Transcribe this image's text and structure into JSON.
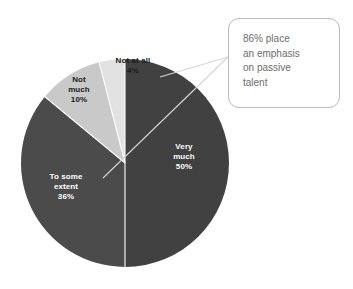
{
  "chart_data": {
    "type": "pie",
    "title": "",
    "categories": [
      "Very much",
      "To some extent",
      "Not much",
      "Not at all"
    ],
    "values": [
      50,
      36,
      10,
      4
    ],
    "value_labels": [
      "50%",
      "36%",
      "10%",
      "4%"
    ],
    "unit": "%",
    "total": 100,
    "legend": "none",
    "grid": false,
    "slices": [
      {
        "label": "Very much",
        "label_line1": "Very",
        "label_line2": "much",
        "value": 50,
        "value_label": "50%",
        "color": "#414141",
        "text_color": "#ffffff",
        "start_angle": 0,
        "end_angle": 180
      },
      {
        "label": "To some extent",
        "label_line1": "To some",
        "label_line2": "extent",
        "value": 36,
        "value_label": "36%",
        "color": "#4b4b4b",
        "text_color": "#ffffff",
        "start_angle": 180,
        "end_angle": 309.6
      },
      {
        "label": "Not much",
        "label_line1": "Not",
        "label_line2": "much",
        "value": 10,
        "value_label": "10%",
        "color": "#c9c9c9",
        "text_color": "#1a1a1a",
        "start_angle": 309.6,
        "end_angle": 345.6
      },
      {
        "label": "Not at all",
        "label_line1": "Not at all",
        "label_line2": "",
        "value": 4,
        "value_label": "4%",
        "color": "#e2e2e2",
        "text_color": "#1a1a1a",
        "start_angle": 345.6,
        "end_angle": 360
      }
    ],
    "annotations": [
      {
        "name": "passive-talent-callout",
        "lines": [
          "86% place",
          "an emphasis",
          "on passive",
          "talent"
        ],
        "text": "86% place an emphasis on passive talent",
        "value": 86,
        "value_label": "86%",
        "border_color": "#b9b9b9",
        "text_color": "#6d6d6d",
        "background": "#ffffff"
      }
    ],
    "colors": {
      "very_much": "#414141",
      "to_some_extent": "#4b4b4b",
      "not_much": "#c9c9c9",
      "not_at_all": "#e2e2e2",
      "background": "#ffffff",
      "slice_divider": "#ffffff",
      "leader_line": "#d6d6d6"
    },
    "geometry": {
      "center_x": 125,
      "center_y": 163,
      "radius": 104
    }
  },
  "callout": {
    "line1": "86% place",
    "line2": "an emphasis",
    "line3": "on passive",
    "line4": "talent"
  },
  "labels": {
    "very_much": {
      "line1": "Very",
      "line2": "much",
      "line3": "50%"
    },
    "to_some_extent": {
      "line1": "To some",
      "line2": "extent",
      "line3": "36%"
    },
    "not_much": {
      "line1": "Not",
      "line2": "much",
      "line3": "10%"
    },
    "not_at_all": {
      "line1": "Not at all",
      "line2": "4%"
    }
  }
}
